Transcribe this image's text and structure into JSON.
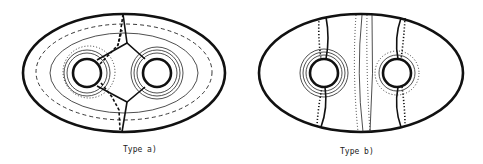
{
  "figure": {
    "panels": [
      {
        "id": "a",
        "label": "Type a)",
        "description": "Genus-2 surface (ellipse with two holes) showing a pants decomposition: a vertical curve through the middle with a hexagonal arc system between the holes, nested solid/dashed/dotted curves around both holes."
      },
      {
        "id": "b",
        "label": "Type b)",
        "description": "Genus-2 surface (ellipse with two holes) with vertical curves passing through each hole and a central vertical band, concentric solid and dotted circles around the holes."
      }
    ]
  },
  "colors": {
    "stroke": "#111111",
    "background": "#ffffff"
  }
}
